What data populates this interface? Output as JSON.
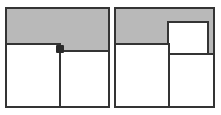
{
  "figure": {
    "type": "geometric-diagram",
    "background_color": "#ffffff",
    "shaded_color": "#b9b9b9",
    "unshaded_color": "#ffffff",
    "stroke_color": "#343434",
    "panels": [
      {
        "id": "panel-left",
        "name": "left-diagram",
        "frame": {
          "x": 5,
          "y": 7,
          "width": 105,
          "height": 101
        },
        "regions": [
          {
            "id": "left-lower-left-square",
            "name": "lower-left-white-square",
            "fill": "#ffffff",
            "x": 5,
            "y": 43,
            "width": 56,
            "height": 65
          },
          {
            "id": "left-lower-right-square",
            "name": "lower-right-white-square",
            "fill": "#ffffff",
            "x": 59,
            "y": 50,
            "width": 51,
            "height": 58
          },
          {
            "id": "left-shaded-top",
            "name": "top-shaded-region",
            "fill": "#b9b9b9",
            "x": 5,
            "y": 7,
            "width": 105,
            "height": 43
          }
        ],
        "markers": [
          {
            "id": "left-junction-dot",
            "name": "interior-junction-dot",
            "x": 57,
            "y": 46,
            "size": 8
          }
        ]
      },
      {
        "id": "panel-right",
        "name": "right-diagram",
        "frame": {
          "x": 114,
          "y": 7,
          "width": 101,
          "height": 101
        },
        "regions": [
          {
            "id": "right-lower-left-square",
            "name": "lower-left-white-square",
            "fill": "#ffffff",
            "x": 114,
            "y": 43,
            "width": 56,
            "height": 65
          },
          {
            "id": "right-lower-right-square",
            "name": "lower-right-white-square",
            "fill": "#ffffff",
            "x": 168,
            "y": 53,
            "width": 47,
            "height": 55
          },
          {
            "id": "right-upper-right-square",
            "name": "upper-right-white-square",
            "fill": "#ffffff",
            "x": 167,
            "y": 21,
            "width": 42,
            "height": 34
          },
          {
            "id": "right-shaded-top",
            "name": "top-shaded-region",
            "fill": "#b9b9b9",
            "x": 114,
            "y": 7,
            "width": 101,
            "height": 46
          }
        ],
        "markers": []
      }
    ]
  }
}
